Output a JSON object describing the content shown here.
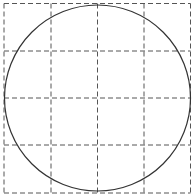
{
  "diagram": {
    "type": "circle-inscribed-in-grid",
    "grid": {
      "rows": 4,
      "cols": 4,
      "x_lines": [
        4,
        51,
        97.5,
        144,
        190.5
      ],
      "y_lines": [
        3.5,
        51,
        98,
        145,
        193
      ],
      "stroke_color": "#555555",
      "dash": "5,3"
    },
    "circle": {
      "cx": 97.5,
      "cy": 98,
      "r": 93,
      "stroke_color": "#333333"
    },
    "background": "#ffffff"
  }
}
